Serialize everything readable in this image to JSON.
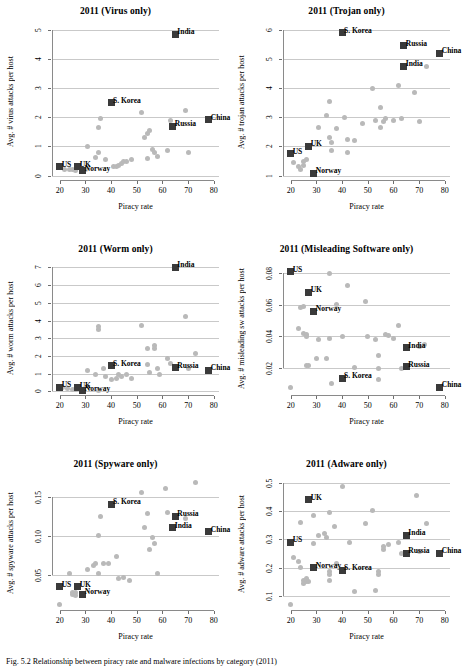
{
  "figure": {
    "caption": "Fig. 5.2  Relationship between piracy rate and malware infections by category (2011)",
    "xlabel": "Piracy rate",
    "marker_color_generic": "#b9b9b9",
    "marker_color_labeled": "#3a3a3a",
    "gridline_color": "#c9c9c9"
  },
  "chart_data": [
    {
      "type": "scatter",
      "title": "2011 (Virus only)",
      "xlabel": "Piracy rate",
      "ylabel": "Avg. # virus attacks per host",
      "xlim": [
        17,
        82
      ],
      "ylim": [
        -0.15,
        5.2
      ],
      "xticks": [
        20,
        30,
        40,
        50,
        60,
        70,
        80
      ],
      "yticks": [
        0,
        1,
        2,
        3,
        4,
        5
      ],
      "grid": true,
      "legend": "none",
      "labeled_points": [
        {
          "label": "US",
          "x": 20,
          "y": 0.3
        },
        {
          "label": "UK",
          "x": 27,
          "y": 0.3
        },
        {
          "label": "Norway",
          "x": 29,
          "y": 0.17
        },
        {
          "label": "S. Korea",
          "x": 40,
          "y": 2.5
        },
        {
          "label": "India",
          "x": 65,
          "y": 4.85
        },
        {
          "label": "Russia",
          "x": 64,
          "y": 1.7
        },
        {
          "label": "China",
          "x": 78,
          "y": 1.92
        }
      ],
      "points": [
        {
          "x": 22,
          "y": 0.22
        },
        {
          "x": 24,
          "y": 0.2
        },
        {
          "x": 25,
          "y": 0.22
        },
        {
          "x": 26,
          "y": 0.18
        },
        {
          "x": 30,
          "y": 0.2
        },
        {
          "x": 31,
          "y": 1.0
        },
        {
          "x": 35,
          "y": 1.65
        },
        {
          "x": 36,
          "y": 1.95
        },
        {
          "x": 34,
          "y": 0.62
        },
        {
          "x": 35,
          "y": 0.8
        },
        {
          "x": 38,
          "y": 0.55
        },
        {
          "x": 41,
          "y": 0.32
        },
        {
          "x": 42,
          "y": 0.3
        },
        {
          "x": 43,
          "y": 0.35
        },
        {
          "x": 44,
          "y": 0.42
        },
        {
          "x": 45,
          "y": 0.5
        },
        {
          "x": 46,
          "y": 0.5
        },
        {
          "x": 48,
          "y": 0.55
        },
        {
          "x": 52,
          "y": 2.15
        },
        {
          "x": 53,
          "y": 1.3
        },
        {
          "x": 54,
          "y": 1.45
        },
        {
          "x": 54,
          "y": 0.6
        },
        {
          "x": 55,
          "y": 1.55
        },
        {
          "x": 56,
          "y": 0.9
        },
        {
          "x": 57,
          "y": 0.78
        },
        {
          "x": 58,
          "y": 0.65
        },
        {
          "x": 62,
          "y": 0.85
        },
        {
          "x": 63,
          "y": 1.9
        },
        {
          "x": 69,
          "y": 2.25
        },
        {
          "x": 70,
          "y": 0.78
        }
      ]
    },
    {
      "type": "scatter",
      "title": "2011 (Trojan only)",
      "xlabel": "Piracy rate",
      "ylabel": "Avg. # trojan attacks per host",
      "xlim": [
        17,
        82
      ],
      "ylim": [
        0.85,
        6.2
      ],
      "xticks": [
        20,
        30,
        40,
        50,
        60,
        70,
        80
      ],
      "yticks": [
        1,
        2,
        3,
        4,
        5,
        6
      ],
      "grid": true,
      "legend": "none",
      "labeled_points": [
        {
          "label": "US",
          "x": 20,
          "y": 1.75
        },
        {
          "label": "UK",
          "x": 27,
          "y": 2.0
        },
        {
          "label": "Norway",
          "x": 29,
          "y": 1.08
        },
        {
          "label": "S. Korea",
          "x": 40,
          "y": 5.9
        },
        {
          "label": "India",
          "x": 64,
          "y": 4.75
        },
        {
          "label": "Russia",
          "x": 64,
          "y": 5.45
        },
        {
          "label": "China",
          "x": 78,
          "y": 5.2
        }
      ],
      "points": [
        {
          "x": 21,
          "y": 1.45
        },
        {
          "x": 23,
          "y": 1.3
        },
        {
          "x": 24,
          "y": 1.2
        },
        {
          "x": 25,
          "y": 1.5
        },
        {
          "x": 25,
          "y": 1.35
        },
        {
          "x": 26,
          "y": 1.55
        },
        {
          "x": 31,
          "y": 2.65
        },
        {
          "x": 34,
          "y": 3.05
        },
        {
          "x": 35,
          "y": 3.55
        },
        {
          "x": 35,
          "y": 2.3
        },
        {
          "x": 36,
          "y": 2.15
        },
        {
          "x": 36,
          "y": 1.85
        },
        {
          "x": 38,
          "y": 2.6
        },
        {
          "x": 41,
          "y": 3.0
        },
        {
          "x": 42,
          "y": 2.25
        },
        {
          "x": 42,
          "y": 1.8
        },
        {
          "x": 45,
          "y": 2.2
        },
        {
          "x": 48,
          "y": 2.8
        },
        {
          "x": 52,
          "y": 4.0
        },
        {
          "x": 53,
          "y": 2.9
        },
        {
          "x": 55,
          "y": 3.35
        },
        {
          "x": 55,
          "y": 2.65
        },
        {
          "x": 56,
          "y": 2.85
        },
        {
          "x": 57,
          "y": 2.95
        },
        {
          "x": 60,
          "y": 2.9
        },
        {
          "x": 62,
          "y": 4.1
        },
        {
          "x": 63,
          "y": 2.95
        },
        {
          "x": 68,
          "y": 3.85
        },
        {
          "x": 70,
          "y": 2.85
        },
        {
          "x": 73,
          "y": 4.75
        }
      ]
    },
    {
      "type": "scatter",
      "title": "2011 (Worm only)",
      "xlabel": "Piracy rate",
      "ylabel": "Avg. # worm attacks per host",
      "xlim": [
        17,
        82
      ],
      "ylim": [
        -0.2,
        7.3
      ],
      "xticks": [
        20,
        30,
        40,
        50,
        60,
        70,
        80
      ],
      "yticks": [
        0,
        1,
        2,
        3,
        4,
        5,
        6,
        7
      ],
      "grid": true,
      "legend": "none",
      "labeled_points": [
        {
          "label": "US",
          "x": 20,
          "y": 0.25
        },
        {
          "label": "UK",
          "x": 27,
          "y": 0.2
        },
        {
          "label": "Norway",
          "x": 29,
          "y": 0.05
        },
        {
          "label": "S. Korea",
          "x": 40,
          "y": 1.45
        },
        {
          "label": "India",
          "x": 65,
          "y": 7.0
        },
        {
          "label": "Russia",
          "x": 65,
          "y": 1.35
        },
        {
          "label": "China",
          "x": 78,
          "y": 1.2
        }
      ],
      "points": [
        {
          "x": 21,
          "y": 0.2
        },
        {
          "x": 23,
          "y": 0.15
        },
        {
          "x": 25,
          "y": 0.1
        },
        {
          "x": 26,
          "y": 0.12
        },
        {
          "x": 31,
          "y": 1.2
        },
        {
          "x": 34,
          "y": 0.95
        },
        {
          "x": 35,
          "y": 3.5
        },
        {
          "x": 35,
          "y": 3.65
        },
        {
          "x": 35,
          "y": 0.05
        },
        {
          "x": 37,
          "y": 1.3
        },
        {
          "x": 38,
          "y": 0.85
        },
        {
          "x": 40,
          "y": 0.65
        },
        {
          "x": 42,
          "y": 0.75
        },
        {
          "x": 43,
          "y": 0.95
        },
        {
          "x": 44,
          "y": 0.85
        },
        {
          "x": 46,
          "y": 0.95
        },
        {
          "x": 48,
          "y": 0.75
        },
        {
          "x": 52,
          "y": 3.7
        },
        {
          "x": 54,
          "y": 2.4
        },
        {
          "x": 54,
          "y": 1.5
        },
        {
          "x": 55,
          "y": 1.05
        },
        {
          "x": 57,
          "y": 2.6
        },
        {
          "x": 57,
          "y": 2.45
        },
        {
          "x": 58,
          "y": 1.3
        },
        {
          "x": 59,
          "y": 0.95
        },
        {
          "x": 62,
          "y": 1.85
        },
        {
          "x": 63,
          "y": 1.55
        },
        {
          "x": 69,
          "y": 4.2
        },
        {
          "x": 70,
          "y": 1.3
        },
        {
          "x": 73,
          "y": 2.15
        }
      ]
    },
    {
      "type": "scatter",
      "title": "2011 (Misleading Software only)",
      "xlabel": "Piracy rate",
      "ylabel": "Avg. # misleading sw attacks per host",
      "xlim": [
        17,
        82
      ],
      "ylim": [
        0.003,
        0.087
      ],
      "xticks": [
        20,
        30,
        40,
        50,
        60,
        70,
        80
      ],
      "yticks": [
        0.02,
        0.04,
        0.06,
        0.08
      ],
      "grid": true,
      "legend": "none",
      "labeled_points": [
        {
          "label": "US",
          "x": 20,
          "y": 0.081
        },
        {
          "label": "UK",
          "x": 27,
          "y": 0.068
        },
        {
          "label": "Norway",
          "x": 29,
          "y": 0.056
        },
        {
          "label": "S. Korea",
          "x": 40,
          "y": 0.0135
        },
        {
          "label": "India",
          "x": 65,
          "y": 0.033
        },
        {
          "label": "Russia",
          "x": 65,
          "y": 0.021
        },
        {
          "label": "China",
          "x": 78,
          "y": 0.008
        }
      ],
      "points": [
        {
          "x": 20,
          "y": 0.0075
        },
        {
          "x": 23,
          "y": 0.045
        },
        {
          "x": 24,
          "y": 0.058
        },
        {
          "x": 25,
          "y": 0.059
        },
        {
          "x": 25,
          "y": 0.042
        },
        {
          "x": 26,
          "y": 0.041
        },
        {
          "x": 26,
          "y": 0.04
        },
        {
          "x": 26,
          "y": 0.0215
        },
        {
          "x": 27,
          "y": 0.0215
        },
        {
          "x": 27,
          "y": 0.067
        },
        {
          "x": 30,
          "y": 0.026
        },
        {
          "x": 31,
          "y": 0.038
        },
        {
          "x": 34,
          "y": 0.026
        },
        {
          "x": 35,
          "y": 0.08
        },
        {
          "x": 35,
          "y": 0.039
        },
        {
          "x": 36,
          "y": 0.0105
        },
        {
          "x": 38,
          "y": 0.06
        },
        {
          "x": 40,
          "y": 0.04
        },
        {
          "x": 42,
          "y": 0.072
        },
        {
          "x": 45,
          "y": 0.0205
        },
        {
          "x": 49,
          "y": 0.062
        },
        {
          "x": 50,
          "y": 0.04
        },
        {
          "x": 53,
          "y": 0.038
        },
        {
          "x": 54,
          "y": 0.028
        },
        {
          "x": 54,
          "y": 0.0195
        },
        {
          "x": 54,
          "y": 0.0125
        },
        {
          "x": 57,
          "y": 0.041
        },
        {
          "x": 58,
          "y": 0.0405
        },
        {
          "x": 60,
          "y": 0.039
        },
        {
          "x": 62,
          "y": 0.047
        },
        {
          "x": 63,
          "y": 0.0195
        },
        {
          "x": 70,
          "y": 0.0335
        },
        {
          "x": 72,
          "y": 0.035
        }
      ]
    },
    {
      "type": "scatter",
      "title": "2011 (Spyware only)",
      "xlabel": "Piracy rate",
      "ylabel": "Avg. # spyware attacks per host",
      "xlim": [
        17,
        82
      ],
      "ylim": [
        0.005,
        0.175
      ],
      "xticks": [
        20,
        30,
        40,
        50,
        60,
        70,
        80
      ],
      "yticks": [
        0.05,
        0.1,
        0.15
      ],
      "grid": true,
      "legend": "none",
      "labeled_points": [
        {
          "label": "US",
          "x": 20,
          "y": 0.035
        },
        {
          "label": "UK",
          "x": 27,
          "y": 0.035
        },
        {
          "label": "Norway",
          "x": 29,
          "y": 0.025
        },
        {
          "label": "S. Korea",
          "x": 40,
          "y": 0.14
        },
        {
          "label": "India",
          "x": 64,
          "y": 0.11
        },
        {
          "label": "Russia",
          "x": 65,
          "y": 0.125
        },
        {
          "label": "China",
          "x": 78,
          "y": 0.105
        }
      ],
      "points": [
        {
          "x": 20,
          "y": 0.012
        },
        {
          "x": 24,
          "y": 0.052
        },
        {
          "x": 25,
          "y": 0.028
        },
        {
          "x": 25,
          "y": 0.025
        },
        {
          "x": 26,
          "y": 0.027
        },
        {
          "x": 26,
          "y": 0.024
        },
        {
          "x": 31,
          "y": 0.057
        },
        {
          "x": 33,
          "y": 0.062
        },
        {
          "x": 34,
          "y": 0.065
        },
        {
          "x": 35,
          "y": 0.1
        },
        {
          "x": 35,
          "y": 0.052
        },
        {
          "x": 36,
          "y": 0.125
        },
        {
          "x": 37,
          "y": 0.064
        },
        {
          "x": 39,
          "y": 0.065
        },
        {
          "x": 42,
          "y": 0.073
        },
        {
          "x": 43,
          "y": 0.045
        },
        {
          "x": 45,
          "y": 0.047
        },
        {
          "x": 47,
          "y": 0.043
        },
        {
          "x": 52,
          "y": 0.155
        },
        {
          "x": 53,
          "y": 0.11
        },
        {
          "x": 54,
          "y": 0.128
        },
        {
          "x": 55,
          "y": 0.082
        },
        {
          "x": 56,
          "y": 0.098
        },
        {
          "x": 57,
          "y": 0.09
        },
        {
          "x": 58,
          "y": 0.052
        },
        {
          "x": 61,
          "y": 0.16
        },
        {
          "x": 62,
          "y": 0.13
        },
        {
          "x": 69,
          "y": 0.122
        },
        {
          "x": 73,
          "y": 0.168
        }
      ]
    },
    {
      "type": "scatter",
      "title": "2011 (Adware only)",
      "xlabel": "Piracy rate",
      "ylabel": "Avg. # adware attacks per host",
      "xlim": [
        17,
        82
      ],
      "ylim": [
        0.05,
        0.52
      ],
      "xticks": [
        20,
        30,
        40,
        50,
        60,
        70,
        80
      ],
      "yticks": [
        0.1,
        0.2,
        0.3,
        0.4,
        0.5
      ],
      "grid": true,
      "legend": "none",
      "labeled_points": [
        {
          "label": "US",
          "x": 20,
          "y": 0.29
        },
        {
          "label": "UK",
          "x": 27,
          "y": 0.44
        },
        {
          "label": "Norway",
          "x": 29,
          "y": 0.2
        },
        {
          "label": "S. Korea",
          "x": 40,
          "y": 0.19
        },
        {
          "label": "India",
          "x": 65,
          "y": 0.315
        },
        {
          "label": "Russia",
          "x": 65,
          "y": 0.25
        },
        {
          "label": "China",
          "x": 78,
          "y": 0.25
        }
      ],
      "points": [
        {
          "x": 20,
          "y": 0.07
        },
        {
          "x": 21,
          "y": 0.235
        },
        {
          "x": 23,
          "y": 0.22
        },
        {
          "x": 24,
          "y": 0.36
        },
        {
          "x": 24,
          "y": 0.2
        },
        {
          "x": 25,
          "y": 0.155
        },
        {
          "x": 25,
          "y": 0.145
        },
        {
          "x": 26,
          "y": 0.15
        },
        {
          "x": 26,
          "y": 0.16
        },
        {
          "x": 27,
          "y": 0.15
        },
        {
          "x": 29,
          "y": 0.385
        },
        {
          "x": 29,
          "y": 0.285
        },
        {
          "x": 31,
          "y": 0.315
        },
        {
          "x": 33,
          "y": 0.32
        },
        {
          "x": 34,
          "y": 0.305
        },
        {
          "x": 35,
          "y": 0.395
        },
        {
          "x": 35,
          "y": 0.185
        },
        {
          "x": 35,
          "y": 0.175
        },
        {
          "x": 35,
          "y": 0.155
        },
        {
          "x": 37,
          "y": 0.345
        },
        {
          "x": 38,
          "y": 0.215
        },
        {
          "x": 40,
          "y": 0.485
        },
        {
          "x": 43,
          "y": 0.29
        },
        {
          "x": 45,
          "y": 0.115
        },
        {
          "x": 49,
          "y": 0.355
        },
        {
          "x": 52,
          "y": 0.4
        },
        {
          "x": 53,
          "y": 0.12
        },
        {
          "x": 54,
          "y": 0.185
        },
        {
          "x": 54,
          "y": 0.175
        },
        {
          "x": 56,
          "y": 0.265
        },
        {
          "x": 56,
          "y": 0.275
        },
        {
          "x": 58,
          "y": 0.28
        },
        {
          "x": 62,
          "y": 0.29
        },
        {
          "x": 63,
          "y": 0.25
        },
        {
          "x": 69,
          "y": 0.455
        },
        {
          "x": 70,
          "y": 0.255
        },
        {
          "x": 73,
          "y": 0.355
        }
      ]
    }
  ]
}
